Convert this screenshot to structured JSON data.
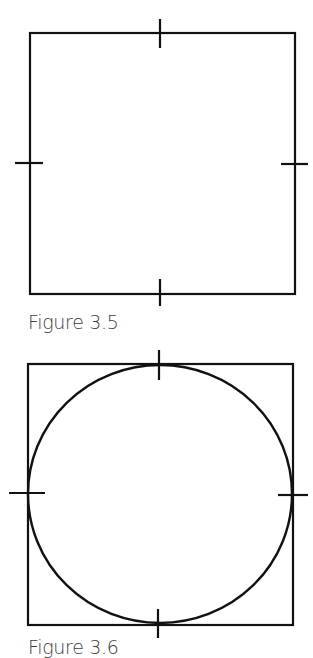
{
  "figures": [
    {
      "id": "fig-3-5",
      "caption": "Figure 3.5",
      "description": "Square with short tick marks at the midpoint of each side",
      "square": {
        "x1": 29,
        "y1": 33,
        "x2": 295,
        "y2": 294
      },
      "tick_marks": [
        "top",
        "right",
        "bottom",
        "left"
      ]
    },
    {
      "id": "fig-3-6",
      "caption": "Figure 3.6",
      "description": "Square with tick marks at each side midpoint and an inscribed circle touching all four ticks",
      "square": {
        "x1": 28,
        "y1": 363,
        "x2": 293,
        "y2": 625
      },
      "tick_marks": [
        "top",
        "right",
        "bottom",
        "left"
      ],
      "inscribed_circle": true
    }
  ],
  "colors": {
    "line": "#111111",
    "caption": "#3c3c3c",
    "background": "#ffffff"
  }
}
